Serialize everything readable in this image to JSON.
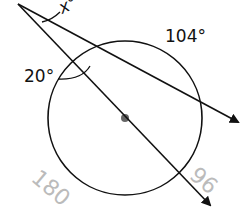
{
  "diagram": {
    "labels": {
      "x_angle": "x°",
      "angle_20": "20°",
      "arc_104": "104°"
    },
    "handwritten": {
      "left": "180",
      "right": "96"
    },
    "colors": {
      "stroke": "#111111",
      "center_dot": "#666666",
      "handwriting": "#bbbbbb"
    }
  }
}
